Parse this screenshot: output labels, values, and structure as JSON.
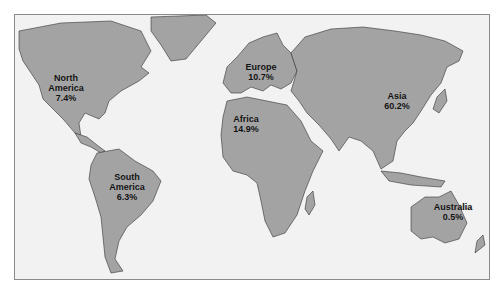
{
  "map": {
    "type": "world-continents-share",
    "background": "#f2f2f2",
    "land_color": "#a3a3a3",
    "border_color": "#333333",
    "regions": [
      {
        "id": "north-america",
        "name_lines": [
          "North",
          "America"
        ],
        "value": "7.4%"
      },
      {
        "id": "europe",
        "name_lines": [
          "Europe"
        ],
        "value": "10.7%"
      },
      {
        "id": "asia",
        "name_lines": [
          "Asia"
        ],
        "value": "60.2%"
      },
      {
        "id": "africa",
        "name_lines": [
          "Africa"
        ],
        "value": "14.9%"
      },
      {
        "id": "south-america",
        "name_lines": [
          "South",
          "America"
        ],
        "value": "6.3%"
      },
      {
        "id": "australia",
        "name_lines": [
          "Australia"
        ],
        "value": "0.5%"
      }
    ]
  }
}
